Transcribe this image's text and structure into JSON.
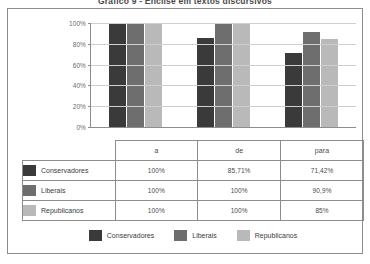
{
  "chart_data": {
    "type": "bar",
    "title": "Gráfico 9 - Ênclise em textos discursivos",
    "xlabel": "",
    "ylabel": "",
    "ylim": [
      0,
      100
    ],
    "ytick_labels": [
      "100%",
      "80%",
      "60%",
      "40%",
      "20%",
      "0%"
    ],
    "ytick_values": [
      100,
      80,
      60,
      40,
      20,
      0
    ],
    "grid": true,
    "legend_position": "bottom",
    "categories": [
      "a",
      "de",
      "para"
    ],
    "series": [
      {
        "name": "Conservadores",
        "color": "#3a3a3a",
        "values": [
          100,
          85.71,
          71.42
        ],
        "labels": [
          "100%",
          "85,71%",
          "71,42%"
        ]
      },
      {
        "name": "Liberais",
        "color": "#6e6e6e",
        "values": [
          100,
          100,
          90.9
        ],
        "labels": [
          "100%",
          "100%",
          "90,9%"
        ]
      },
      {
        "name": "Republicanos",
        "color": "#b9b9b9",
        "values": [
          100,
          100,
          85
        ],
        "labels": [
          "100%",
          "100%",
          "85%"
        ]
      }
    ]
  },
  "table": {
    "column_headers": [
      "",
      "a",
      "de",
      "para"
    ],
    "rows": [
      {
        "label": "Conservadores",
        "color": "#3a3a3a",
        "values": [
          "100%",
          "85,71%",
          "71,42%"
        ]
      },
      {
        "label": "Liberais",
        "color": "#6e6e6e",
        "values": [
          "100%",
          "100%",
          "90,9%"
        ]
      },
      {
        "label": "Republicanos",
        "color": "#b9b9b9",
        "values": [
          "100%",
          "100%",
          "85%"
        ]
      }
    ]
  },
  "legend": {
    "items": [
      {
        "label": "Conservadores",
        "color": "#3a3a3a"
      },
      {
        "label": "Liberais",
        "color": "#6e6e6e"
      },
      {
        "label": "Republicanos",
        "color": "#b9b9b9"
      }
    ]
  }
}
